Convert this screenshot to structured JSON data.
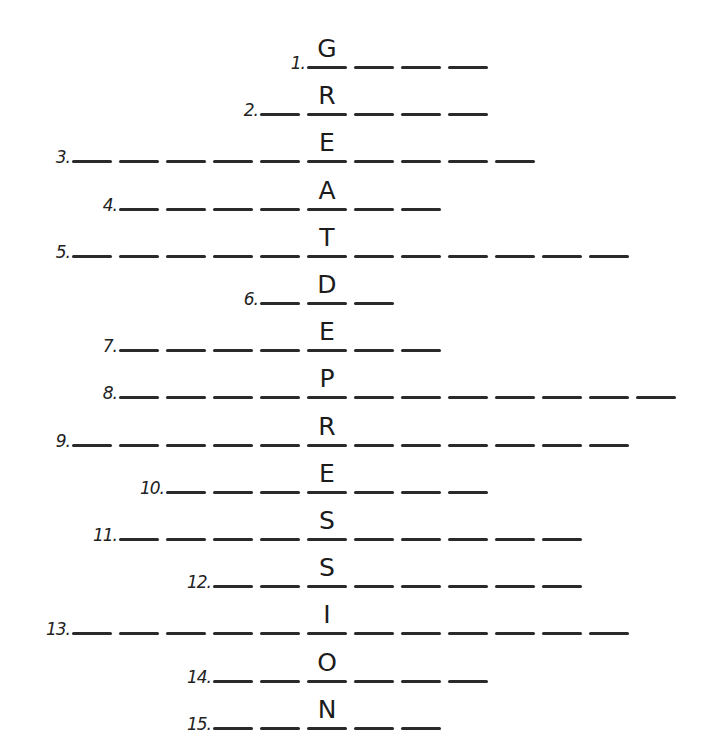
{
  "puzzle": {
    "type": "acrostic",
    "key_word": "GREATDEPRESSION",
    "column_center_x": 327,
    "blank_pitch": 47,
    "rows": [
      {
        "number": "1.",
        "key_letter": "G",
        "before": 0,
        "after": 3
      },
      {
        "number": "2.",
        "key_letter": "R",
        "before": 1,
        "after": 3
      },
      {
        "number": "3.",
        "key_letter": "E",
        "before": 5,
        "after": 4
      },
      {
        "number": "4.",
        "key_letter": "A",
        "before": 4,
        "after": 2
      },
      {
        "number": "5.",
        "key_letter": "T",
        "before": 5,
        "after": 6
      },
      {
        "number": "6.",
        "key_letter": "D",
        "before": 1,
        "after": 1
      },
      {
        "number": "7.",
        "key_letter": "E",
        "before": 4,
        "after": 2
      },
      {
        "number": "8.",
        "key_letter": "P",
        "before": 4,
        "after": 7
      },
      {
        "number": "9.",
        "key_letter": "R",
        "before": 5,
        "after": 6
      },
      {
        "number": "10.",
        "key_letter": "E",
        "before": 3,
        "after": 3
      },
      {
        "number": "11.",
        "key_letter": "S",
        "before": 4,
        "after": 5
      },
      {
        "number": "12.",
        "key_letter": "S",
        "before": 2,
        "after": 5
      },
      {
        "number": "13.",
        "key_letter": "I",
        "before": 5,
        "after": 6
      },
      {
        "number": "14.",
        "key_letter": "O",
        "before": 2,
        "after": 3
      },
      {
        "number": "15.",
        "key_letter": "N",
        "before": 2,
        "after": 2
      }
    ]
  }
}
